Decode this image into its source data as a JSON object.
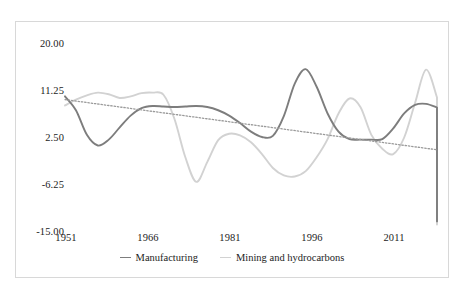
{
  "chart_data": {
    "type": "line",
    "title": "",
    "xlabel": "",
    "ylabel": "",
    "xlim": [
      1951,
      2019
    ],
    "ylim": [
      -15.0,
      20.0
    ],
    "grid": false,
    "legend_position": "bottom-center",
    "y_ticks": [
      "20.00",
      "11.25",
      "2.50",
      "-6.25",
      "-15.00"
    ],
    "y_tick_values": [
      20.0,
      11.25,
      2.5,
      -6.25,
      -15.0
    ],
    "x_ticks": [
      "1951",
      "1966",
      "1981",
      "1996",
      "2011"
    ],
    "x_tick_values": [
      1951,
      1966,
      1981,
      1996,
      2011
    ],
    "colors": {
      "manufacturing": "#7d7d7d",
      "mining": "#d2d2d2",
      "trendline": "#9a9a9a",
      "frame": "#d8d8d8",
      "text": "#1c1c1c"
    },
    "series": [
      {
        "name": "Manufacturing",
        "color": "#7d7d7d",
        "style": "solid",
        "x": [
          1951,
          1953,
          1955,
          1957,
          1959,
          1961,
          1963,
          1965,
          1967,
          1969,
          1971,
          1973,
          1975,
          1977,
          1979,
          1981,
          1983,
          1985,
          1987,
          1989,
          1991,
          1993,
          1995,
          1997,
          1999,
          2001,
          2003,
          2005,
          2007,
          2009,
          2011,
          2013,
          2015,
          2017,
          2019
        ],
        "values": [
          10.2,
          7.6,
          3.0,
          1.0,
          2.1,
          4.4,
          6.6,
          8.0,
          8.4,
          8.3,
          8.2,
          8.3,
          8.4,
          8.2,
          7.6,
          6.6,
          5.2,
          3.6,
          2.6,
          2.8,
          6.5,
          12.6,
          15.3,
          12.0,
          7.0,
          3.6,
          2.2,
          2.1,
          2.1,
          2.2,
          4.2,
          7.0,
          8.6,
          8.8,
          8.1
        ],
        "end_value": -13.2
      },
      {
        "name": "Mining and hydrocarbons",
        "color": "#d2d2d2",
        "style": "solid",
        "x": [
          1951,
          1953,
          1955,
          1957,
          1959,
          1961,
          1963,
          1965,
          1967,
          1969,
          1971,
          1973,
          1975,
          1977,
          1979,
          1981,
          1983,
          1985,
          1987,
          1989,
          1991,
          1993,
          1995,
          1997,
          1999,
          2001,
          2003,
          2005,
          2007,
          2009,
          2011,
          2013,
          2015,
          2017,
          2019
        ],
        "values": [
          8.5,
          9.6,
          10.4,
          10.9,
          10.6,
          9.9,
          10.2,
          10.8,
          10.9,
          10.5,
          6.0,
          -1.2,
          -5.8,
          -2.1,
          2.0,
          3.2,
          2.9,
          1.6,
          -0.6,
          -3.2,
          -4.6,
          -4.8,
          -3.8,
          -1.2,
          2.2,
          7.0,
          9.8,
          8.2,
          3.0,
          0.4,
          -0.6,
          2.5,
          9.0,
          15.2,
          10.0
        ],
        "end_value": -13.8
      },
      {
        "name": "trendline",
        "color": "#9a9a9a",
        "style": "dotted",
        "x": [
          1951,
          2019
        ],
        "values": [
          9.6,
          0.2
        ]
      }
    ]
  },
  "legend": {
    "items": [
      {
        "label": "Manufacturing",
        "color": "#7d7d7d"
      },
      {
        "label": "Mining and hydrocarbons",
        "color": "#d2d2d2"
      }
    ]
  }
}
